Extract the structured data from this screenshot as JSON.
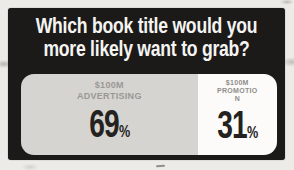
{
  "colors": {
    "photo_background": "#ecebe8",
    "card_background": "#1b1a18",
    "title_text": "#f5f4f2",
    "left_segment_background": "#d6d4d1",
    "right_segment_background": "#fcfbfa",
    "left_label_text": "#9a9894",
    "right_label_text": "#8f8d8a",
    "percent_text": "#232220"
  },
  "title": {
    "line1": "Which book title would you",
    "line2": "more likely want to grab?"
  },
  "poll": {
    "left": {
      "label_line1": "$100M",
      "label_line2": "ADVERTISING",
      "percent": "69",
      "percent_symbol": "%"
    },
    "right": {
      "label_line1": "$100M",
      "label_line2": "PROMOTIO",
      "label_line3": "N",
      "percent": "31",
      "percent_symbol": "%"
    }
  },
  "chart_data": {
    "type": "bar",
    "title": "Which book title would you more likely want to grab?",
    "categories": [
      "$100M ADVERTISING",
      "$100M PROMOTION"
    ],
    "values": [
      69,
      31
    ],
    "unit": "%",
    "orientation": "horizontal-100pct-split",
    "xlim": [
      0,
      100
    ],
    "legend": "none",
    "grid": false
  }
}
